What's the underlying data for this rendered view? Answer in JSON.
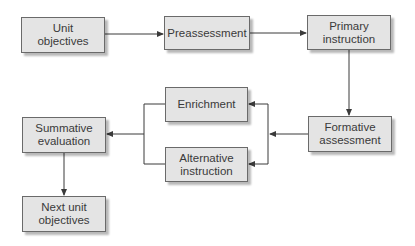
{
  "diagram": {
    "type": "flowchart",
    "colors": {
      "box_fill": "#e4e4e4",
      "box_border": "#6a6a6a",
      "line": "#3a3a3a",
      "text": "#3a3a3a"
    },
    "nodes": [
      {
        "id": "unit_objectives",
        "label": "Unit\nobjectives",
        "x": 21,
        "y": 17,
        "w": 84,
        "h": 36
      },
      {
        "id": "preassessment",
        "label": "Preassessment",
        "x": 164,
        "y": 16,
        "w": 86,
        "h": 34
      },
      {
        "id": "primary_instruction",
        "label": "Primary\ninstruction",
        "x": 307,
        "y": 15,
        "w": 84,
        "h": 35
      },
      {
        "id": "formative_assessment",
        "label": "Formative\nassessment",
        "x": 308,
        "y": 116,
        "w": 84,
        "h": 36
      },
      {
        "id": "enrichment",
        "label": "Enrichment",
        "x": 165,
        "y": 87,
        "w": 83,
        "h": 35
      },
      {
        "id": "alternative_instruction",
        "label": "Alternative\ninstruction",
        "x": 165,
        "y": 147,
        "w": 83,
        "h": 35
      },
      {
        "id": "summative_evaluation",
        "label": "Summative\nevaluation",
        "x": 22,
        "y": 117,
        "w": 84,
        "h": 36
      },
      {
        "id": "next_unit_objectives",
        "label": "Next unit\nobjectives",
        "x": 22,
        "y": 196,
        "w": 84,
        "h": 36
      }
    ],
    "edges": [
      {
        "from": "unit_objectives",
        "to": "preassessment"
      },
      {
        "from": "preassessment",
        "to": "primary_instruction"
      },
      {
        "from": "primary_instruction",
        "to": "formative_assessment"
      },
      {
        "from": "formative_assessment",
        "to": "enrichment"
      },
      {
        "from": "formative_assessment",
        "to": "alternative_instruction"
      },
      {
        "from": "enrichment",
        "to": "summative_evaluation"
      },
      {
        "from": "alternative_instruction",
        "to": "summative_evaluation"
      },
      {
        "from": "summative_evaluation",
        "to": "next_unit_objectives"
      }
    ]
  }
}
